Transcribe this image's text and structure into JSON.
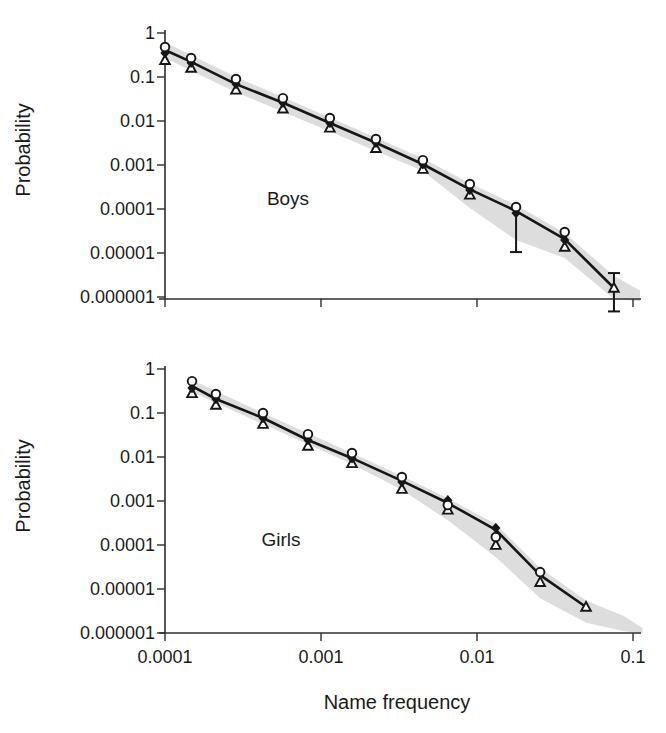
{
  "figure": {
    "x_axis_title": "Name frequency",
    "y_axis_title": "Probability",
    "x_tick_labels": [
      "0.0001",
      "0.001",
      "0.01",
      "0.1"
    ],
    "y_tick_labels": [
      "1",
      "0.1",
      "0.01",
      "0.001",
      "0.0001",
      "0.00001",
      "0.000001"
    ],
    "colors": {
      "line": "#161616",
      "marker_stroke": "#161616",
      "marker_fill_open": "#ffffff",
      "band": "#d9d9d9",
      "axis": "#2e2e2e",
      "text": "#1b1b1b",
      "background": "#ffffff"
    }
  },
  "chart_data": [
    {
      "type": "line",
      "label": "Boys",
      "xlabel": "Name frequency",
      "ylabel": "Probability",
      "xscale": "log",
      "yscale": "log",
      "xlim": [
        0.0001,
        0.1
      ],
      "ylim": [
        1e-06,
        1
      ],
      "xticks": [
        0.0001,
        0.001,
        0.01,
        0.1
      ],
      "yticks": [
        1,
        0.1,
        0.01,
        0.001,
        0.0001,
        1e-05,
        1e-06
      ],
      "line": {
        "x": [
          0.0001,
          0.000147,
          0.000285,
          0.00057,
          0.00114,
          0.00225,
          0.0045,
          0.009,
          0.0178,
          0.0365,
          0.0755
        ],
        "p": [
          0.41,
          0.22,
          0.069,
          0.026,
          0.009,
          0.0032,
          0.00104,
          0.00028,
          9e-05,
          2.06e-05,
          1.6e-06
        ]
      },
      "series": [
        {
          "name": "open-circle",
          "marker": "circle-open",
          "points": [
            [
              0.0001,
              0.48
            ],
            [
              0.000147,
              0.27
            ],
            [
              0.000285,
              0.09
            ],
            [
              0.00057,
              0.033
            ],
            [
              0.00114,
              0.0117
            ],
            [
              0.00225,
              0.0039
            ],
            [
              0.0045,
              0.00129
            ],
            [
              0.009,
              0.00037
            ],
            [
              0.0178,
              0.000111
            ],
            [
              0.0365,
              2.99e-05
            ]
          ]
        },
        {
          "name": "filled-diamond",
          "marker": "diamond-filled",
          "points": [
            [
              0.0001,
              0.35
            ],
            [
              0.000147,
              0.21
            ],
            [
              0.000285,
              0.069
            ],
            [
              0.00057,
              0.026
            ],
            [
              0.00114,
              0.009
            ],
            [
              0.00225,
              0.0032
            ],
            [
              0.0045,
              0.00104
            ],
            [
              0.009,
              0.00027
            ],
            [
              0.0178,
              8.14e-05
            ],
            [
              0.0365,
              1.97e-05
            ]
          ]
        },
        {
          "name": "open-triangle",
          "marker": "triangle-open",
          "points": [
            [
              0.0001,
              0.24
            ],
            [
              0.000147,
              0.16
            ],
            [
              0.000285,
              0.051
            ],
            [
              0.00057,
              0.019
            ],
            [
              0.00114,
              0.007
            ],
            [
              0.00225,
              0.0024
            ],
            [
              0.0045,
              0.00081
            ],
            [
              0.009,
              0.00021
            ],
            [
              0.0365,
              1.37e-05
            ],
            [
              0.0755,
              1.6e-06
            ]
          ]
        }
      ],
      "error_bars": [
        {
          "x": 0.0178,
          "p_from": 8.14e-05,
          "p_to": 1.05e-05,
          "cap_top": false,
          "cap_bottom": true
        },
        {
          "x": 0.0755,
          "p_from": 3.5e-06,
          "p_to": 4.7e-07,
          "cap_top": true,
          "cap_bottom": true
        }
      ],
      "band": {
        "x": [
          0.0001,
          0.000285,
          0.00114,
          0.0045,
          0.009,
          0.0178,
          0.0365,
          0.0755,
          0.111
        ],
        "hi": [
          0.62,
          0.1,
          0.012,
          0.00143,
          0.000385,
          0.000123,
          2.85e-05,
          3e-06,
          1.4e-06
        ],
        "lo": [
          0.27,
          0.045,
          0.0058,
          0.00073,
          0.000105,
          1.97e-05,
          7.7e-06,
          9e-07,
          8e-07
        ]
      }
    },
    {
      "type": "line",
      "label": "Girls",
      "xlabel": "Name frequency",
      "ylabel": "Probability",
      "xscale": "log",
      "yscale": "log",
      "xlim": [
        0.0001,
        0.1
      ],
      "ylim": [
        1e-06,
        1
      ],
      "xticks": [
        0.0001,
        0.001,
        0.01,
        0.1
      ],
      "yticks": [
        1,
        0.1,
        0.01,
        0.001,
        0.0001,
        1e-05,
        1e-06
      ],
      "line": {
        "x": [
          0.000149,
          0.000212,
          0.000425,
          0.000825,
          0.00158,
          0.0033,
          0.0065,
          0.0132,
          0.0254,
          0.05
        ],
        "p": [
          0.41,
          0.208,
          0.077,
          0.0243,
          0.0094,
          0.00286,
          0.0009,
          0.00022,
          2.06e-05,
          3.9e-06
        ]
      },
      "series": [
        {
          "name": "open-circle",
          "marker": "circle-open",
          "points": [
            [
              0.000149,
              0.53
            ],
            [
              0.000212,
              0.27
            ],
            [
              0.000425,
              0.1
            ],
            [
              0.000825,
              0.033
            ],
            [
              0.00158,
              0.0123
            ],
            [
              0.0033,
              0.0035
            ],
            [
              0.0065,
              0.00081
            ],
            [
              0.0132,
              0.000152
            ],
            [
              0.0254,
              2.42e-05
            ]
          ]
        },
        {
          "name": "filled-diamond",
          "marker": "diamond-filled",
          "points": [
            [
              0.000149,
              0.37
            ],
            [
              0.000212,
              0.208
            ],
            [
              0.000425,
              0.077
            ],
            [
              0.000825,
              0.0243
            ],
            [
              0.00158,
              0.0094
            ],
            [
              0.0033,
              0.00271
            ],
            [
              0.0065,
              0.00104
            ],
            [
              0.0132,
              0.000243
            ]
          ]
        },
        {
          "name": "open-triangle",
          "marker": "triangle-open",
          "points": [
            [
              0.000149,
              0.28
            ],
            [
              0.000212,
              0.152
            ],
            [
              0.000425,
              0.056
            ],
            [
              0.000825,
              0.0178
            ],
            [
              0.00158,
              0.0072
            ],
            [
              0.0033,
              0.00187
            ],
            [
              0.0065,
              0.00063
            ],
            [
              0.0132,
              9.98e-05
            ],
            [
              0.0254,
              1.43e-05
            ],
            [
              0.05,
              3.9e-06
            ]
          ]
        }
      ],
      "error_bars": [],
      "band": {
        "x": [
          0.000149,
          0.000425,
          0.00158,
          0.0033,
          0.0065,
          0.0132,
          0.0254,
          0.05,
          0.088,
          0.115
        ],
        "hi": [
          0.56,
          0.1,
          0.0123,
          0.00369,
          0.00116,
          0.000298,
          2.99e-05,
          5.5e-06,
          2.4e-06,
          1.3e-06
        ],
        "lo": [
          0.3,
          0.056,
          0.00694,
          0.00177,
          0.000367,
          5.28e-05,
          6.2e-06,
          1.7e-06,
          1.1e-06,
          1e-06
        ]
      }
    }
  ]
}
